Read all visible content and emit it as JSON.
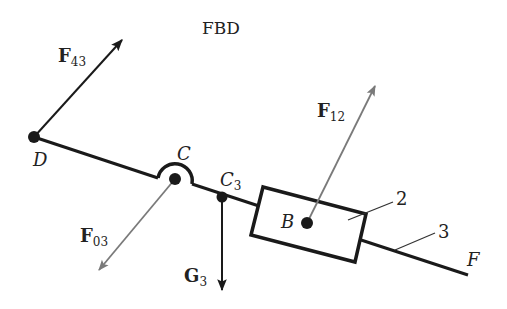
{
  "title": "FBD",
  "colors": {
    "link": "#1a1a1a",
    "force_dark": "#1a1a1a",
    "force_gray": "#7a7a7a",
    "background": "#ffffff"
  },
  "points": {
    "D": "D",
    "C": "C",
    "C3_main": "C",
    "C3_sub": "3",
    "B": "B",
    "F": "F"
  },
  "bodies": {
    "slider": "2",
    "link": "3"
  },
  "forces": {
    "F43": {
      "main": "F",
      "sub": "43"
    },
    "F12": {
      "main": "F",
      "sub": "12"
    },
    "F03": {
      "main": "F",
      "sub": "03"
    },
    "G3": {
      "main": "G",
      "sub": "3"
    }
  }
}
